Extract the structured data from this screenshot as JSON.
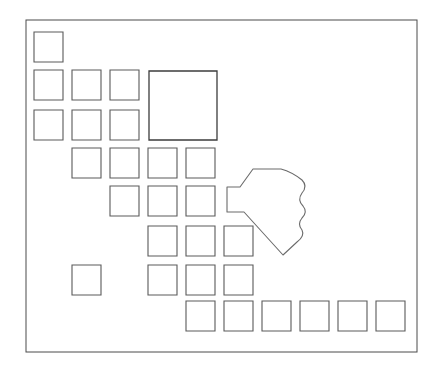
{
  "figure": {
    "background_color": "#ffffff",
    "width": 440,
    "height": 368
  },
  "frame": {
    "name": "outer-boundary",
    "x": 26,
    "y": 20,
    "width": 391,
    "height": 332,
    "stroke": "#4a4a4a"
  },
  "plots": {
    "stroke": "#5a5a5a",
    "large_stroke": "#3c3c3c",
    "items": [
      {
        "id": "plot-r1-c1",
        "x": 34,
        "y": 32,
        "w": 29,
        "h": 30,
        "size": "small"
      },
      {
        "id": "plot-r2-c1",
        "x": 34,
        "y": 70,
        "w": 29,
        "h": 30,
        "size": "small"
      },
      {
        "id": "plot-r2-c2",
        "x": 72,
        "y": 70,
        "w": 29,
        "h": 30,
        "size": "small"
      },
      {
        "id": "plot-r2-c3",
        "x": 110,
        "y": 70,
        "w": 29,
        "h": 30,
        "size": "small"
      },
      {
        "id": "plot-r2-big",
        "x": 149,
        "y": 71,
        "w": 68,
        "h": 69,
        "size": "large"
      },
      {
        "id": "plot-r3-c1",
        "x": 34,
        "y": 110,
        "w": 29,
        "h": 30,
        "size": "small"
      },
      {
        "id": "plot-r3-c2",
        "x": 72,
        "y": 110,
        "w": 29,
        "h": 30,
        "size": "small"
      },
      {
        "id": "plot-r3-c3",
        "x": 110,
        "y": 110,
        "w": 29,
        "h": 30,
        "size": "small"
      },
      {
        "id": "plot-r4-c2",
        "x": 72,
        "y": 148,
        "w": 29,
        "h": 30,
        "size": "small"
      },
      {
        "id": "plot-r4-c3",
        "x": 110,
        "y": 148,
        "w": 29,
        "h": 30,
        "size": "small"
      },
      {
        "id": "plot-r4-c4",
        "x": 148,
        "y": 148,
        "w": 29,
        "h": 30,
        "size": "small"
      },
      {
        "id": "plot-r4-c5",
        "x": 186,
        "y": 148,
        "w": 29,
        "h": 30,
        "size": "small"
      },
      {
        "id": "plot-r5-c3",
        "x": 110,
        "y": 186,
        "w": 29,
        "h": 30,
        "size": "small"
      },
      {
        "id": "plot-r5-c4",
        "x": 148,
        "y": 186,
        "w": 29,
        "h": 30,
        "size": "small"
      },
      {
        "id": "plot-r5-c5",
        "x": 186,
        "y": 186,
        "w": 29,
        "h": 30,
        "size": "small"
      },
      {
        "id": "plot-r6-c4",
        "x": 148,
        "y": 226,
        "w": 29,
        "h": 30,
        "size": "small"
      },
      {
        "id": "plot-r6-c5",
        "x": 186,
        "y": 226,
        "w": 29,
        "h": 30,
        "size": "small"
      },
      {
        "id": "plot-r6-c6",
        "x": 224,
        "y": 226,
        "w": 29,
        "h": 30,
        "size": "small"
      },
      {
        "id": "plot-r7-c2",
        "x": 72,
        "y": 265,
        "w": 29,
        "h": 30,
        "size": "small"
      },
      {
        "id": "plot-r7-c4",
        "x": 148,
        "y": 265,
        "w": 29,
        "h": 30,
        "size": "small"
      },
      {
        "id": "plot-r7-c5",
        "x": 186,
        "y": 265,
        "w": 29,
        "h": 30,
        "size": "small"
      },
      {
        "id": "plot-r7-c6",
        "x": 224,
        "y": 265,
        "w": 29,
        "h": 30,
        "size": "small"
      },
      {
        "id": "plot-r8-c5",
        "x": 186,
        "y": 301,
        "w": 29,
        "h": 30,
        "size": "small"
      },
      {
        "id": "plot-r8-c6",
        "x": 224,
        "y": 301,
        "w": 29,
        "h": 30,
        "size": "small"
      },
      {
        "id": "plot-r8-c7",
        "x": 262,
        "y": 301,
        "w": 29,
        "h": 30,
        "size": "small"
      },
      {
        "id": "plot-r8-c8",
        "x": 300,
        "y": 301,
        "w": 29,
        "h": 30,
        "size": "small"
      },
      {
        "id": "plot-r8-c9",
        "x": 338,
        "y": 301,
        "w": 29,
        "h": 30,
        "size": "small"
      },
      {
        "id": "plot-r8-c10",
        "x": 376,
        "y": 301,
        "w": 29,
        "h": 30,
        "size": "small"
      }
    ]
  },
  "pond": {
    "id": "pond-outline",
    "stroke": "#6b6b6b",
    "fill": "#ffffff",
    "path": "M 253 169 L 240 187 L 227 187 L 227 212 L 244 212 L 283 255 L 297 242 Q 305 236 302 230 Q 297 224 302 218 Q 308 212 303 206 Q 297 200 302 193 Q 308 186 302 180 Q 292 172 281 169 Z"
  }
}
